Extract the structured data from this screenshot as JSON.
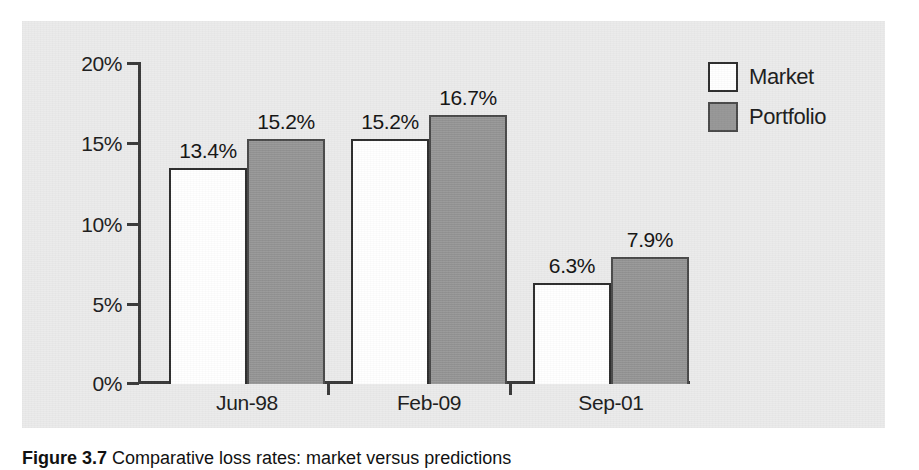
{
  "chart_data": {
    "type": "bar",
    "title": "",
    "subtitle": "",
    "xlabel": "",
    "ylabel": "",
    "categories": [
      "Jun-98",
      "Feb-09",
      "Sep-01"
    ],
    "series": [
      {
        "name": "Market",
        "values": [
          13.4,
          15.2,
          6.3
        ],
        "color": "#ffffff"
      },
      {
        "name": "Portfolio",
        "values": [
          15.2,
          16.7,
          7.9
        ],
        "color": "#979797"
      }
    ],
    "value_labels": [
      [
        "13.4%",
        "15.2%",
        "6.3%"
      ],
      [
        "15.2%",
        "16.7%",
        "7.9%"
      ]
    ],
    "ylim": [
      0,
      20
    ],
    "ytick_values": [
      0,
      5,
      10,
      15,
      20
    ],
    "ytick_labels": [
      "0%",
      "5%",
      "10%",
      "15%",
      "20%"
    ],
    "grid": false,
    "legend_position": "top-right",
    "value_format": "percent"
  },
  "legend": {
    "items": [
      {
        "label": "Market",
        "swatch": "white-square-swatch"
      },
      {
        "label": "Portfolio",
        "swatch": "grey-square-swatch"
      }
    ]
  },
  "caption": {
    "figure_number": "Figure 3.7",
    "text": "Comparative loss rates: market versus predictions"
  },
  "colors": {
    "panel_background": "#ebebeb",
    "page_background": "#ffffff",
    "market_fill": "#ffffff",
    "portfolio_fill": "#979797",
    "axis": "#3a3a3a",
    "text": "#1d1d1d"
  }
}
